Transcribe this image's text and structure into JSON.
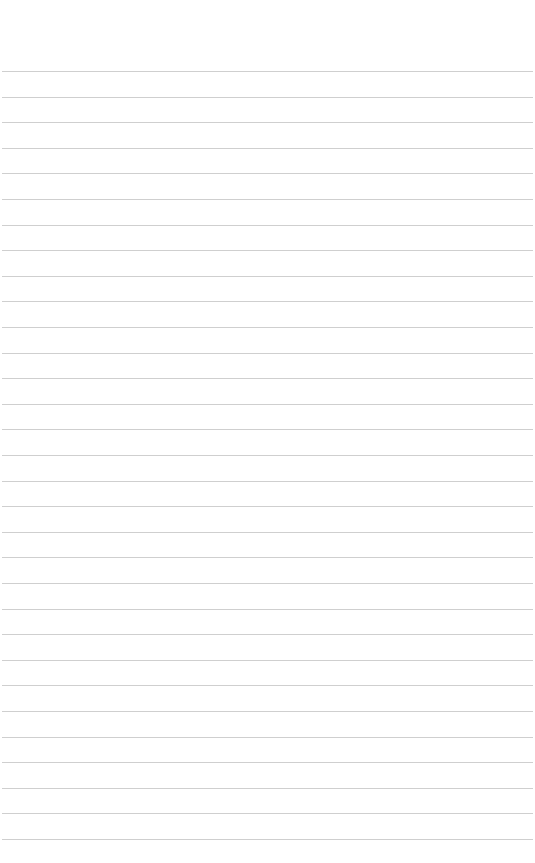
{
  "page": {
    "type": "lined-paper",
    "background_color": "#ffffff",
    "rule_color": "#cfcfcf",
    "rule_count": 31,
    "first_rule_y": 71,
    "rule_spacing": 25.6,
    "text": ""
  }
}
